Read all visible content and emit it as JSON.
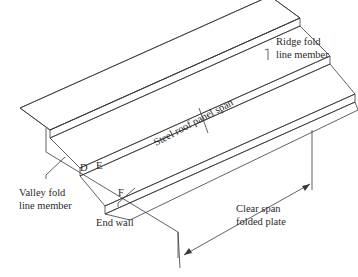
{
  "figure": {
    "type": "isometric folded plate roof diagram",
    "labels": {
      "ridge": [
        "Ridge fold",
        "line member"
      ],
      "valley": [
        "Valley fold",
        "line member"
      ],
      "end_wall": "End wall",
      "clear_span": [
        "Clear span",
        "folded plate"
      ],
      "panel_span": "Steel roof panel span",
      "point_d": "D",
      "point_e": "E",
      "point_f": "F"
    },
    "colors": {
      "line": "#3a3a3a",
      "background": "#ffffff",
      "text": "#2a2a2a"
    }
  }
}
